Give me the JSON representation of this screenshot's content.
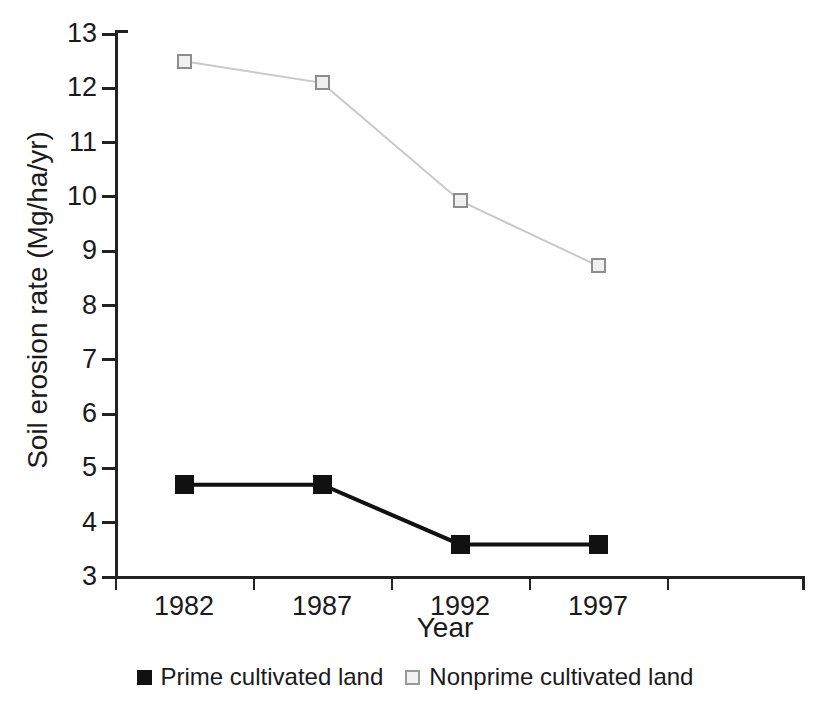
{
  "chart_data": {
    "type": "line",
    "title": "",
    "xlabel": "Year",
    "ylabel": "Soil erosion rate (Mg/ha/yr)",
    "categories": [
      "1982",
      "1987",
      "1992",
      "1997"
    ],
    "ylim": [
      3,
      13
    ],
    "yticks": [
      3,
      4,
      5,
      6,
      7,
      8,
      9,
      10,
      11,
      12,
      13
    ],
    "ytick_labels": [
      "3",
      "4",
      "5",
      "6",
      "7",
      "8",
      "9",
      "10",
      "11",
      "12",
      "13"
    ],
    "grid": false,
    "legend_position": "bottom-center",
    "series": [
      {
        "name": "Prime cultivated land",
        "marker": "filled-square",
        "color": "#111111",
        "line_color": "#111111",
        "values": [
          4.7,
          4.7,
          3.6,
          3.6
        ]
      },
      {
        "name": "Nonprime cultivated land",
        "marker": "open-square",
        "color": "#f0f0f0",
        "line_color": "#c9c9c9",
        "values": [
          12.5,
          12.1,
          9.93,
          8.73
        ]
      }
    ]
  },
  "legend": {
    "entries": [
      {
        "label": "Prime cultivated land",
        "swatch": "filled-square-icon"
      },
      {
        "label": "Nonprime cultivated land",
        "swatch": "open-square-icon"
      }
    ]
  },
  "colors": {
    "axis": "#222222",
    "prime": "#111111",
    "nonprime_fill": "#f0f0f0",
    "nonprime_edge": "#8d8d8d",
    "nonprime_line": "#c9c9c9",
    "background": "#ffffff"
  }
}
